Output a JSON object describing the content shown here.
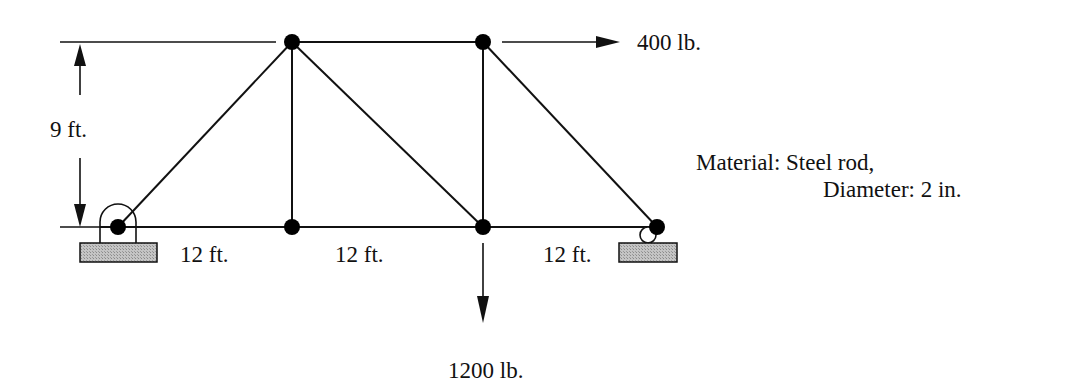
{
  "diagram": {
    "type": "truss",
    "dimensions": {
      "height_label": "9 ft.",
      "span_labels": [
        "12 ft.",
        "12 ft.",
        "12 ft."
      ]
    },
    "loads": {
      "horizontal": "400 lb.",
      "vertical": "1200 lb."
    },
    "material": {
      "line1": "Material: Steel rod,",
      "line2": "Diameter: 2 in."
    },
    "supports": [
      "pin",
      "roller"
    ],
    "colors": {
      "line": "#111111",
      "support_fill": "#b8b8b8"
    }
  }
}
